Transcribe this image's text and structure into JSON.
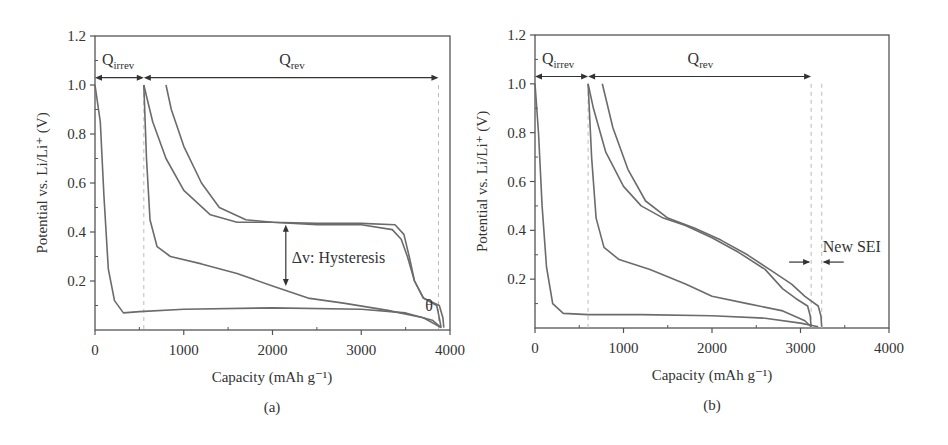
{
  "chart_data": [
    {
      "panel": "(a)",
      "type": "line",
      "xlabel": "Capacity (mAh g⁻¹)",
      "ylabel": "Potential vs. Li/Li⁺ (V)",
      "xlim": [
        0,
        4000
      ],
      "ylim": [
        0,
        1.2
      ],
      "xticks": [
        0,
        1000,
        2000,
        3000,
        4000
      ],
      "yticks": [
        0.2,
        0.4,
        0.6,
        0.8,
        1.0,
        1.2
      ],
      "annotations": {
        "q_irrev": "Q",
        "q_irrev_sub": "irrev",
        "q_rev": "Q",
        "q_rev_sub": "rev",
        "hysteresis": "Δv: Hysteresis",
        "theta": "θ",
        "q_irrev_range": [
          0,
          550
        ],
        "q_rev_range": [
          550,
          3870
        ],
        "hysteresis_x": 2150,
        "hysteresis_y": [
          0.43,
          0.18
        ],
        "dashed_lines_x": [
          550,
          3870
        ]
      },
      "series": [
        {
          "name": "1st discharge",
          "points": [
            [
              0,
              1.0
            ],
            [
              60,
              0.85
            ],
            [
              100,
              0.55
            ],
            [
              150,
              0.25
            ],
            [
              220,
              0.12
            ],
            [
              320,
              0.07
            ],
            [
              500,
              0.075
            ],
            [
              1000,
              0.085
            ],
            [
              2000,
              0.09
            ],
            [
              3000,
              0.085
            ],
            [
              3500,
              0.07
            ],
            [
              3800,
              0.04
            ],
            [
              3900,
              0.01
            ]
          ]
        },
        {
          "name": "charge 1",
          "points": [
            [
              3900,
              0.01
            ],
            [
              3880,
              0.05
            ],
            [
              3850,
              0.1
            ],
            [
              3700,
              0.13
            ],
            [
              3600,
              0.2
            ],
            [
              3520,
              0.3
            ],
            [
              3450,
              0.37
            ],
            [
              3350,
              0.41
            ],
            [
              3000,
              0.43
            ],
            [
              2500,
              0.43
            ],
            [
              2000,
              0.44
            ],
            [
              1600,
              0.44
            ],
            [
              1300,
              0.47
            ],
            [
              1000,
              0.57
            ],
            [
              800,
              0.7
            ],
            [
              650,
              0.85
            ],
            [
              550,
              1.0
            ]
          ]
        },
        {
          "name": "2nd discharge",
          "points": [
            [
              550,
              1.0
            ],
            [
              580,
              0.7
            ],
            [
              620,
              0.45
            ],
            [
              700,
              0.34
            ],
            [
              850,
              0.3
            ],
            [
              1200,
              0.27
            ],
            [
              1600,
              0.23
            ],
            [
              2000,
              0.18
            ],
            [
              2400,
              0.13
            ],
            [
              2800,
              0.11
            ],
            [
              3300,
              0.08
            ],
            [
              3700,
              0.05
            ],
            [
              3900,
              0.01
            ]
          ]
        },
        {
          "name": "charge 2",
          "points": [
            [
              3930,
              0.01
            ],
            [
              3920,
              0.05
            ],
            [
              3880,
              0.1
            ],
            [
              3700,
              0.13
            ],
            [
              3600,
              0.2
            ],
            [
              3540,
              0.3
            ],
            [
              3480,
              0.39
            ],
            [
              3380,
              0.43
            ],
            [
              3000,
              0.435
            ],
            [
              2500,
              0.435
            ],
            [
              2000,
              0.44
            ],
            [
              1700,
              0.45
            ],
            [
              1400,
              0.5
            ],
            [
              1200,
              0.6
            ],
            [
              1000,
              0.75
            ],
            [
              860,
              0.9
            ],
            [
              800,
              1.0
            ]
          ]
        }
      ]
    },
    {
      "panel": "(b)",
      "type": "line",
      "xlabel": "Capacity (mAh g⁻¹)",
      "ylabel": "Potential vs. Li/Li⁺ (V)",
      "xlim": [
        0,
        4000
      ],
      "ylim": [
        0,
        1.2
      ],
      "xticks": [
        0,
        1000,
        2000,
        3000,
        4000
      ],
      "yticks": [
        0.2,
        0.4,
        0.6,
        0.8,
        1.0,
        1.2
      ],
      "annotations": {
        "q_irrev": "Q",
        "q_irrev_sub": "irrev",
        "q_rev": "Q",
        "q_rev_sub": "rev",
        "new_sei": "New SEI",
        "q_irrev_range": [
          0,
          600
        ],
        "q_rev_range": [
          600,
          3120
        ],
        "dashed_lines_x": [
          600,
          3120,
          3240
        ]
      },
      "series": [
        {
          "name": "1st discharge",
          "points": [
            [
              0,
              1.0
            ],
            [
              40,
              0.8
            ],
            [
              80,
              0.5
            ],
            [
              130,
              0.25
            ],
            [
              200,
              0.1
            ],
            [
              320,
              0.06
            ],
            [
              600,
              0.055
            ],
            [
              1200,
              0.055
            ],
            [
              2000,
              0.05
            ],
            [
              2600,
              0.04
            ],
            [
              3000,
              0.02
            ],
            [
              3200,
              0.005
            ]
          ]
        },
        {
          "name": "charge 1",
          "points": [
            [
              3120,
              0.005
            ],
            [
              3110,
              0.05
            ],
            [
              3080,
              0.09
            ],
            [
              2950,
              0.12
            ],
            [
              2800,
              0.16
            ],
            [
              2600,
              0.24
            ],
            [
              2300,
              0.31
            ],
            [
              2000,
              0.37
            ],
            [
              1700,
              0.42
            ],
            [
              1450,
              0.45
            ],
            [
              1200,
              0.5
            ],
            [
              1000,
              0.58
            ],
            [
              800,
              0.72
            ],
            [
              660,
              0.9
            ],
            [
              600,
              1.0
            ]
          ]
        },
        {
          "name": "2nd discharge",
          "points": [
            [
              600,
              1.0
            ],
            [
              640,
              0.7
            ],
            [
              690,
              0.45
            ],
            [
              780,
              0.33
            ],
            [
              950,
              0.28
            ],
            [
              1300,
              0.24
            ],
            [
              1700,
              0.18
            ],
            [
              2000,
              0.13
            ],
            [
              2400,
              0.1
            ],
            [
              2800,
              0.07
            ],
            [
              3050,
              0.03
            ],
            [
              3120,
              0.005
            ]
          ]
        },
        {
          "name": "charge 2",
          "points": [
            [
              3240,
              0.005
            ],
            [
              3230,
              0.05
            ],
            [
              3200,
              0.09
            ],
            [
              3050,
              0.13
            ],
            [
              2900,
              0.18
            ],
            [
              2650,
              0.24
            ],
            [
              2400,
              0.3
            ],
            [
              2100,
              0.36
            ],
            [
              1800,
              0.41
            ],
            [
              1500,
              0.45
            ],
            [
              1250,
              0.52
            ],
            [
              1050,
              0.65
            ],
            [
              880,
              0.82
            ],
            [
              760,
              1.0
            ]
          ]
        }
      ]
    }
  ],
  "panels": [
    {
      "label": "(a)"
    },
    {
      "label": "(b)"
    }
  ]
}
